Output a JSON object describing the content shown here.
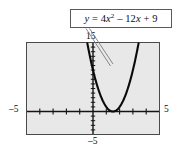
{
  "figure": {
    "background_color": "#ffffff"
  },
  "callout": {
    "name": "equation-callout",
    "equation_plain": "y = 4x2 - 12x + 9",
    "lhs": "y",
    "equals": "=",
    "term1_coef": "4",
    "term1_var": "x",
    "term1_exp": "2",
    "term2": "– 12",
    "term2_var": "x",
    "term3": "+ 9",
    "border_color": "#5a5a5a",
    "fill_color": "#ffffff"
  },
  "axis_labels": {
    "top": "15",
    "left": "–5",
    "right": "5",
    "bottom": "–5"
  },
  "chart_data": {
    "type": "line",
    "xlabel": "",
    "ylabel": "",
    "xlim": [
      -5,
      5
    ],
    "ylim": [
      -5,
      15
    ],
    "grid": false,
    "legend": null,
    "annotations": [
      {
        "text": "y = 4x² – 12x + 9",
        "kind": "callout-box",
        "points_to": "curve right branch"
      }
    ],
    "axis_tick_labels": {
      "x": [
        "-5",
        "5"
      ],
      "y": [
        "-5",
        "15"
      ]
    },
    "x_tick_spacing": 1,
    "y_tick_spacing": 1,
    "function": "y = 4x^2 - 12x + 9",
    "factored": "y = (2x - 3)^2",
    "vertex": [
      1.5,
      0
    ],
    "roots": [
      1.5
    ],
    "series": [
      {
        "name": "y = 4x^2 - 12x + 9",
        "color": "#0a0a0a",
        "x": [
          0.05,
          0.2,
          0.4,
          0.6,
          0.8,
          1.0,
          1.2,
          1.4,
          1.5,
          1.6,
          1.8,
          2.0,
          2.2,
          2.4,
          2.6,
          2.8,
          2.95
        ],
        "y": [
          8.41,
          6.76,
          4.84,
          3.24,
          1.96,
          1.0,
          0.36,
          0.04,
          0.0,
          0.04,
          0.36,
          1.0,
          1.96,
          3.24,
          4.84,
          6.76,
          8.41
        ]
      }
    ],
    "plot_area": {
      "frame_color": "#4a4a4a",
      "fill_color": "#e8e8e8",
      "axis_color": "#1a1a1a"
    }
  }
}
